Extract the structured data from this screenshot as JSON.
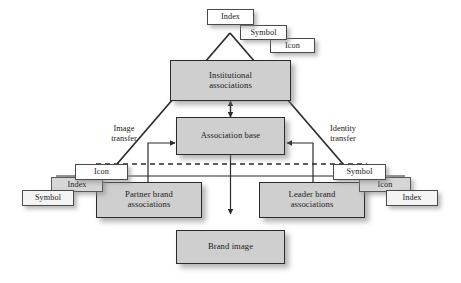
{
  "figure": {
    "type": "flow-diagram",
    "background_color": "#ffffff",
    "box_fill_color": "#cfcfcf",
    "tag_fill_color": "#ffffff",
    "line_color": "#2b2b2b"
  },
  "nodes": {
    "institutional": "Institutional\nassociations",
    "institutional_line1": "Institutional",
    "institutional_line2": "associations",
    "association_base": "Association base",
    "partner_line1": "Partner brand",
    "partner_line2": "associations",
    "leader_line1": "Leader brand",
    "leader_line2": "associations",
    "brand_image": "Brand image"
  },
  "sign_clusters": {
    "top": [
      {
        "label": "Index"
      },
      {
        "label": "Symbol"
      },
      {
        "label": "Icon"
      }
    ],
    "left": [
      {
        "label": "Icon"
      },
      {
        "label": "Index"
      },
      {
        "label": "Symbol"
      }
    ],
    "right": [
      {
        "label": "Symbol"
      },
      {
        "label": "Icon"
      },
      {
        "label": "Index"
      }
    ]
  },
  "annotations": {
    "image_transfer_line1": "Image",
    "image_transfer_line2": "transfer",
    "identity_transfer_line1": "Identity",
    "identity_transfer_line2": "transfer"
  }
}
